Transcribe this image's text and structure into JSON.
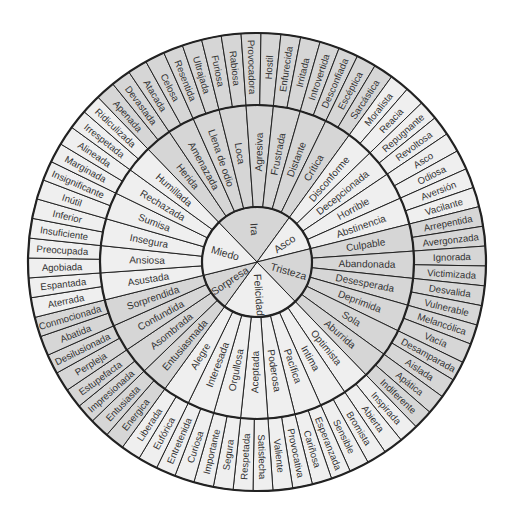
{
  "geometry": {
    "cx": 257,
    "cy": 262,
    "r_inner": 55,
    "r_middle": 157,
    "r_outer": 229
  },
  "colors": {
    "shaded": "#d6d6d6",
    "light": "#efefef",
    "stroke": "#222222",
    "text": "#333333"
  },
  "chart_data": {
    "type": "table",
    "note": "Three concentric rings: core emotions (center), secondary (middle), tertiary (outer). Each secondary emotion maps to two tertiary emotions.",
    "core": [
      {
        "label": "Ira",
        "shaded": true,
        "middle": [
          {
            "label": "Herida",
            "outer": [
              "Apenada",
              "Devastada"
            ]
          },
          {
            "label": "Amenazada",
            "outer": [
              "Atacada",
              "Celosa"
            ]
          },
          {
            "label": "Llena de odio",
            "outer": [
              "Resentida",
              "Ultrajada"
            ]
          },
          {
            "label": "Loca",
            "outer": [
              "Furiosa",
              "Rabiosa"
            ]
          },
          {
            "label": "Agresiva",
            "outer": [
              "Provocadora",
              "Hostil"
            ]
          },
          {
            "label": "Frustrada",
            "outer": [
              "Enfurecida",
              "Irritada"
            ]
          },
          {
            "label": "Distante",
            "outer": [
              "Introvertida",
              "Desconfiada"
            ]
          },
          {
            "label": "Crítica",
            "outer": [
              "Escéptica",
              "Sarcástica"
            ]
          }
        ]
      },
      {
        "label": "Asco",
        "shaded": false,
        "middle": [
          {
            "label": "Disconforme",
            "outer": [
              "Moralista",
              "Reacia"
            ]
          },
          {
            "label": "Decepcionada",
            "outer": [
              "Repugnante",
              "Revoltosa"
            ]
          },
          {
            "label": "Horrible",
            "outer": [
              "Asco",
              "Odiosa"
            ]
          },
          {
            "label": "Abstinencia",
            "outer": [
              "Aversión",
              "Vacilante"
            ]
          }
        ]
      },
      {
        "label": "Tristeza",
        "shaded": true,
        "middle": [
          {
            "label": "Culpable",
            "outer": [
              "Arrepentida",
              "Avergonzada"
            ]
          },
          {
            "label": "Abandonada",
            "outer": [
              "Ignorada",
              "Victimizada"
            ]
          },
          {
            "label": "Desesperada",
            "outer": [
              "Desvalida",
              "Vulnerable"
            ]
          },
          {
            "label": "Deprimida",
            "outer": [
              "Melancólica",
              "Vacía"
            ]
          },
          {
            "label": "Sola",
            "outer": [
              "Desamparada",
              "Aislada"
            ]
          },
          {
            "label": "Aburrida",
            "outer": [
              "Apática",
              "Indiferente"
            ]
          }
        ]
      },
      {
        "label": "Felicidad",
        "shaded": false,
        "middle": [
          {
            "label": "Optimista",
            "outer": [
              "Inspirada",
              "Abierta"
            ]
          },
          {
            "label": "Intima",
            "outer": [
              "Bromista",
              "Sensible"
            ]
          },
          {
            "label": "Pacífica",
            "outer": [
              "Esperanzada",
              "Cariñosa"
            ]
          },
          {
            "label": "Poderosa",
            "outer": [
              "Provocativa",
              "Valiente"
            ]
          },
          {
            "label": "Aceptada",
            "outer": [
              "Satisfecha",
              "Respetada"
            ]
          },
          {
            "label": "Orgullosa",
            "outer": [
              "Segura",
              "Importante"
            ]
          },
          {
            "label": "Interesada",
            "outer": [
              "Curiosa",
              "Entretenida"
            ]
          },
          {
            "label": "Alegre",
            "outer": [
              "Eufórica",
              "Liberada"
            ]
          }
        ]
      },
      {
        "label": "Sorpresa",
        "shaded": true,
        "middle": [
          {
            "label": "Entusiasmada",
            "outer": [
              "Energica",
              "Entusiasta"
            ]
          },
          {
            "label": "Asombrada",
            "outer": [
              "Impresionada",
              "Estupefacta"
            ]
          },
          {
            "label": "Confundida",
            "outer": [
              "Perpleja",
              "Desilusionada"
            ]
          },
          {
            "label": "Sorprendida",
            "outer": [
              "Abatida",
              "Conmocionada"
            ]
          }
        ]
      },
      {
        "label": "Miedo",
        "shaded": false,
        "middle": [
          {
            "label": "Asustada",
            "outer": [
              "Aterrada",
              "Espantada"
            ]
          },
          {
            "label": "Ansiosa",
            "outer": [
              "Agobiada",
              "Preocupada"
            ]
          },
          {
            "label": "Insegura",
            "outer": [
              "Insuficiente",
              "Inferior"
            ]
          },
          {
            "label": "Sumisa",
            "outer": [
              "Inútil",
              "Insignificante"
            ]
          },
          {
            "label": "Rechazada",
            "outer": [
              "Marginada",
              "Alineada"
            ]
          },
          {
            "label": "Humillada",
            "outer": [
              "Irrespetada",
              "Ridiculizada"
            ]
          }
        ]
      }
    ]
  }
}
